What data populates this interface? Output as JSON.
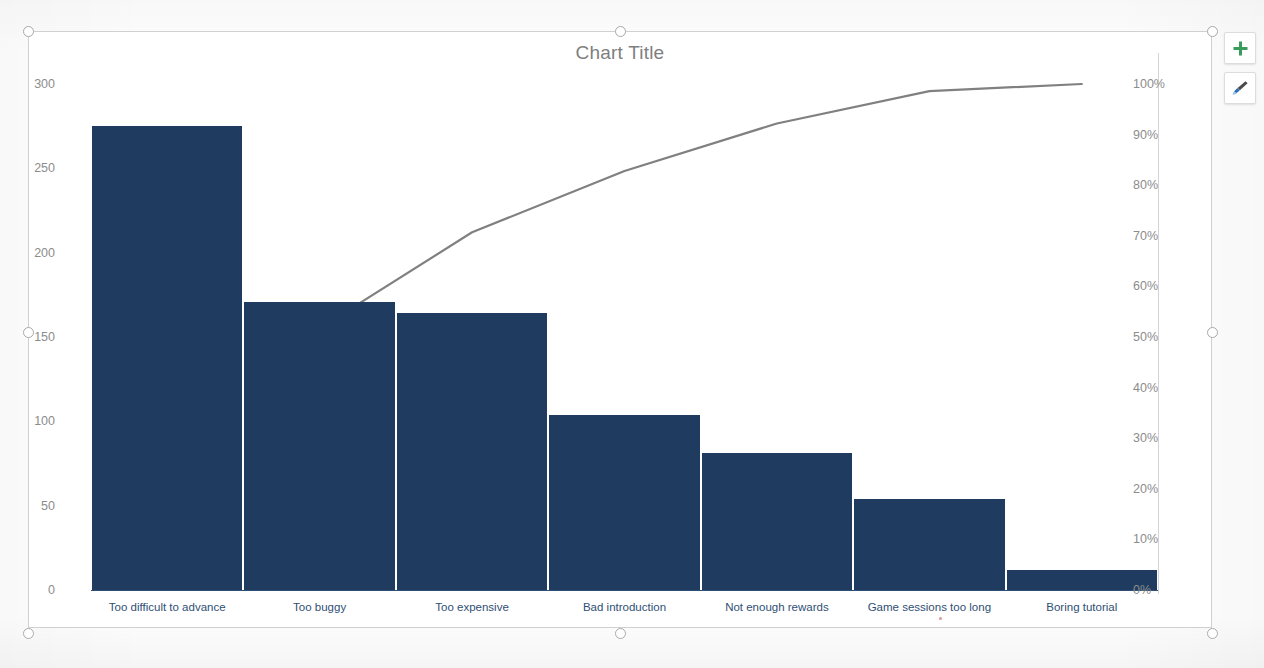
{
  "app": {
    "context": "spreadsheet-chart-object-selected"
  },
  "chart_tools": {
    "buttons": [
      {
        "name": "chart-elements-button",
        "icon": "plus-icon",
        "label": "+",
        "color": "#3a9c5c",
        "tooltip": "Chart Elements"
      },
      {
        "name": "chart-styles-button",
        "icon": "paintbrush-icon",
        "label": "",
        "color": "#2e6fb7",
        "tooltip": "Chart Styles"
      }
    ]
  },
  "selection": {
    "handle_count": 8,
    "handle_color": "#a9a9ac",
    "frame_border_color": "#d0d0d2"
  },
  "chart_data": {
    "type": "bar",
    "title": "Chart Title",
    "xlabel": "",
    "ylabel": "",
    "grid": false,
    "legend": false,
    "categories": [
      "Too difficult to advance",
      "Too buggy",
      "Too expensive",
      "Bad introduction",
      "Not enough rewards",
      "Game sessions too long",
      "Boring tutorial"
    ],
    "series": [
      {
        "name": "Count",
        "type": "bar",
        "axis": "left",
        "color": "#1f3c60",
        "values": [
          275,
          171,
          164,
          104,
          81,
          54,
          12
        ]
      },
      {
        "name": "Cumulative %",
        "type": "line",
        "axis": "right",
        "color": "#808080",
        "values": [
          31.9,
          51.7,
          70.7,
          82.8,
          92.2,
          98.6,
          100.0
        ]
      }
    ],
    "left_axis": {
      "min": 0,
      "max": 300,
      "step": 50,
      "ticks": [
        "0",
        "50",
        "100",
        "150",
        "200",
        "250",
        "300"
      ]
    },
    "right_axis": {
      "min": 0,
      "max": 100,
      "step": 10,
      "ticks": [
        "0%",
        "10%",
        "20%",
        "30%",
        "40%",
        "50%",
        "60%",
        "70%",
        "80%",
        "90%",
        "100%"
      ]
    },
    "total": 861
  }
}
